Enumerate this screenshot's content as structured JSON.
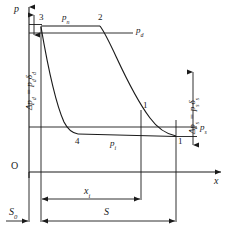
{
  "diagram": {
    "type": "p-x indicator diagram",
    "axes": {
      "y_label": "p",
      "x_label": "x",
      "origin_label": "O"
    },
    "points": [
      {
        "id": "3",
        "label": "3"
      },
      {
        "id": "2",
        "label": "2"
      },
      {
        "id": "4",
        "label": "4"
      },
      {
        "id": "1u",
        "label": "1"
      },
      {
        "id": "1l",
        "label": "1"
      }
    ],
    "pressure_labels": {
      "p_n": {
        "base": "p",
        "sub": "n"
      },
      "p_d": {
        "base": "p",
        "sub": "d"
      },
      "p_i": {
        "base": "p",
        "sub": "i"
      },
      "p_s": {
        "base": "p",
        "sub": "s"
      }
    },
    "annotations": {
      "delta_p_d": {
        "text": "Δp",
        "sub1": "d",
        "eq": " = p",
        "sub2": "d",
        "tail": "δ",
        "sub3": "d"
      },
      "delta_p_s": {
        "text": "Δp",
        "sub1": "s",
        "eq": " = p",
        "sub2": "s",
        "tail": "δ",
        "sub3": "s"
      }
    },
    "dimensions": {
      "s0": {
        "base": "S",
        "sub": "0"
      },
      "xi": {
        "base": "x",
        "sub": "i"
      },
      "s": {
        "base": "S",
        "sub": ""
      }
    },
    "colors": {
      "line": "#1a1a1a",
      "background": "#ffffff",
      "text": "#1a1a1a"
    }
  }
}
